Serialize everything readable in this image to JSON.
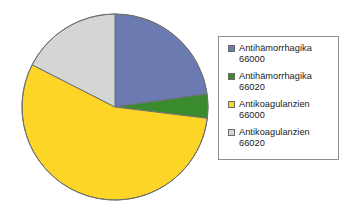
{
  "chart_data": {
    "type": "pie",
    "title": "",
    "subtitle": "",
    "xlabel": "",
    "ylabel": "",
    "legend_position": "right",
    "grid": false,
    "start_angle_deg": 0,
    "direction": "clockwise",
    "categories": [
      "Antihämorrhagika 66000",
      "Antihämorrhagika 66020",
      "Antikoagulanzien 66000",
      "Antikoagulanzien 66020"
    ],
    "values": [
      23,
      4,
      56,
      17
    ],
    "value_unit": "percent",
    "slice_angles_deg": [
      82,
      15,
      200,
      63
    ],
    "colors": [
      "#6b7ab0",
      "#3a8a2e",
      "#fcd526",
      "#d3d6d2"
    ]
  },
  "legend": {
    "items": [
      {
        "label": "Antihämorrhagika\n66000",
        "name": "Antihämorrhagika",
        "code": "66000",
        "color": "#6b7ab0"
      },
      {
        "label": "Antihämorrhagika\n66020",
        "name": "Antihämorrhagika",
        "code": "66020",
        "color": "#3a8a2e"
      },
      {
        "label": "Antikoagulanzien\n66000",
        "name": "Antikoagulanzien",
        "code": "66000",
        "color": "#fcd526"
      },
      {
        "label": "Antikoagulanzien\n66020",
        "name": "Antikoagulanzien",
        "code": "66020",
        "color": "#d3d6d2"
      }
    ]
  },
  "pie": {
    "center_x": 115,
    "center_y": 107,
    "radius": 93,
    "outline_color": "#6f716f"
  }
}
